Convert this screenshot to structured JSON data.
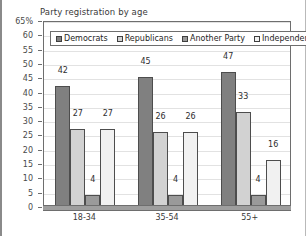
{
  "chart_data": {
    "type": "bar",
    "title": "Party registration by age",
    "xlabel": "",
    "ylabel": "",
    "ylim": [
      0,
      65
    ],
    "ytick_labels": [
      "65%",
      "60",
      "55",
      "50",
      "45",
      "40",
      "35",
      "30",
      "25",
      "20",
      "15",
      "10",
      "5",
      "0"
    ],
    "ytick_values": [
      65,
      60,
      55,
      50,
      45,
      40,
      35,
      30,
      25,
      20,
      15,
      10,
      5,
      0
    ],
    "grid": true,
    "legend_position": "top-inside",
    "categories": [
      "18-34",
      "35-54",
      "55+"
    ],
    "series": [
      {
        "name": "Democrats",
        "values": [
          42,
          45,
          47
        ],
        "color": "#808080"
      },
      {
        "name": "Republicans",
        "values": [
          27,
          26,
          33
        ],
        "color": "#d2d2d2"
      },
      {
        "name": "Another Party",
        "values": [
          4,
          4,
          4
        ],
        "color": "#9a9a9a"
      },
      {
        "name": "Independents",
        "values": [
          27,
          26,
          16
        ],
        "color": "#f1f1f1"
      }
    ]
  },
  "axis": {
    "y_suffix_label": "65%"
  }
}
